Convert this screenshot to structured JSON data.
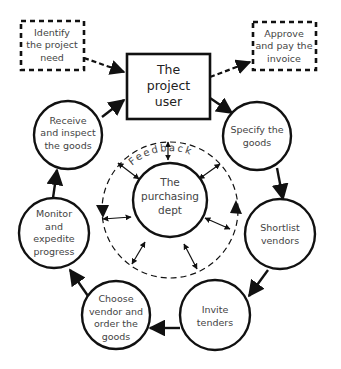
{
  "diagram": {
    "center": {
      "lines": [
        "The",
        "purchasing",
        "dept"
      ]
    },
    "feedback_label": "Feedback",
    "top_box": {
      "lines": [
        "The",
        "project",
        "user"
      ]
    },
    "dashed_boxes": [
      {
        "id": "identify",
        "lines": [
          "Identify",
          "the project",
          "need"
        ]
      },
      {
        "id": "approve",
        "lines": [
          "Approve",
          "and pay the",
          "invoice"
        ]
      }
    ],
    "cycle_steps": [
      {
        "id": "specify",
        "lines": [
          "Specify the",
          "goods"
        ]
      },
      {
        "id": "shortlist",
        "lines": [
          "Shortlist",
          "vendors"
        ]
      },
      {
        "id": "invite",
        "lines": [
          "Invite",
          "tenders"
        ]
      },
      {
        "id": "choose",
        "lines": [
          "Choose",
          "vendor and",
          "order the",
          "goods"
        ]
      },
      {
        "id": "monitor",
        "lines": [
          "Monitor",
          "and",
          "expedite",
          "progress"
        ]
      },
      {
        "id": "receive",
        "lines": [
          "Receive",
          "and inspect",
          "the goods"
        ]
      }
    ],
    "colors": {
      "stroke": "#111111",
      "text": "#444444",
      "background": "#ffffff"
    }
  }
}
